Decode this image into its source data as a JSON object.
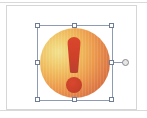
{
  "document": {
    "title": "Slide canvas with selected warning icon",
    "background_color": "#ffffff",
    "page_border_color": "#d6d6d6",
    "rule_color": "#d9d9d9"
  },
  "shape": {
    "name": "warning-exclamation-badge",
    "label": "Warning icon",
    "description": "Orange-to-yellow gradient circle containing a red exclamation mark",
    "selected": true,
    "bounds": {
      "left": 30,
      "top": 19,
      "width": 76,
      "height": 76
    },
    "fill": {
      "type": "radial-gradient",
      "stops": [
        "#f2e08d",
        "#f0cf72",
        "#efb659",
        "#ec9a4c",
        "#e07e46",
        "#d2693e",
        "#c65c38"
      ]
    },
    "glyph": {
      "character": "!",
      "bar_color": "#cf4029",
      "dot_color": "#c9402a"
    }
  },
  "selection": {
    "outline_color": "#8f9ab5",
    "handle_fill": "#ffffff",
    "handle_border": "#6f7c96",
    "handles": [
      {
        "id": "top-left",
        "cursor": "nwse-resize"
      },
      {
        "id": "top-middle",
        "cursor": "ns-resize"
      },
      {
        "id": "top-right",
        "cursor": "nesw-resize"
      },
      {
        "id": "middle-left",
        "cursor": "ew-resize"
      },
      {
        "id": "middle-right",
        "cursor": "ew-resize"
      },
      {
        "id": "bottom-left",
        "cursor": "nesw-resize"
      },
      {
        "id": "bottom-middle",
        "cursor": "ns-resize"
      },
      {
        "id": "bottom-right",
        "cursor": "nwse-resize"
      }
    ],
    "rotate_handle": {
      "id": "rotate",
      "fill": "#e6e6e6",
      "border": "#8a8a8a"
    }
  }
}
